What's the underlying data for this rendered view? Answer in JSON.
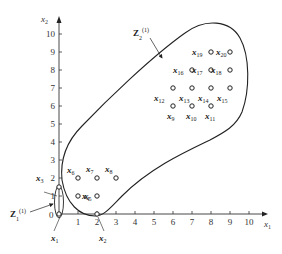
{
  "axes": {
    "x_label": "x",
    "x_label_sub": "1",
    "y_label": "x",
    "y_label_sub": "2",
    "x_ticks": [
      "1",
      "2",
      "3",
      "4",
      "5",
      "6",
      "7",
      "8",
      "9",
      "10"
    ],
    "y_ticks": [
      "1",
      "2",
      "3",
      "4",
      "5",
      "6",
      "7",
      "8",
      "9",
      "10"
    ],
    "origin_label": "0"
  },
  "points": [
    {
      "name": "x",
      "sub": "1",
      "x": 0,
      "y": 0
    },
    {
      "name": "x",
      "sub": "2",
      "x": 2,
      "y": 0
    },
    {
      "name": "x",
      "sub": "3",
      "x": 0,
      "y": 1.5
    },
    {
      "name": "x",
      "sub": "4",
      "x": 1,
      "y": 1
    },
    {
      "name": "x",
      "sub": "5",
      "x": 2,
      "y": 1
    },
    {
      "name": "x",
      "sub": "6",
      "x": 1,
      "y": 2
    },
    {
      "name": "x",
      "sub": "7",
      "x": 2,
      "y": 2
    },
    {
      "name": "x",
      "sub": "8",
      "x": 3,
      "y": 2
    },
    {
      "name": "x",
      "sub": "9",
      "x": 6,
      "y": 6
    },
    {
      "name": "x",
      "sub": "10",
      "x": 7,
      "y": 6
    },
    {
      "name": "x",
      "sub": "11",
      "x": 8,
      "y": 6
    },
    {
      "name": "x",
      "sub": "12",
      "x": 6,
      "y": 7
    },
    {
      "name": "x",
      "sub": "13",
      "x": 7,
      "y": 7
    },
    {
      "name": "x",
      "sub": "14",
      "x": 8,
      "y": 7
    },
    {
      "name": "x",
      "sub": "15",
      "x": 9,
      "y": 7
    },
    {
      "name": "x",
      "sub": "16",
      "x": 7,
      "y": 8
    },
    {
      "name": "x",
      "sub": "17",
      "x": 8,
      "y": 8
    },
    {
      "name": "x",
      "sub": "18",
      "x": 9,
      "y": 8
    },
    {
      "name": "x",
      "sub": "19",
      "x": 8,
      "y": 9
    },
    {
      "name": "x",
      "sub": "20",
      "x": 9,
      "y": 9
    }
  ],
  "sets": {
    "z1": {
      "name": "Z",
      "sub": "1",
      "sup": "(1)"
    },
    "z2": {
      "name": "Z",
      "sub": "2",
      "sup": "(1)"
    }
  }
}
